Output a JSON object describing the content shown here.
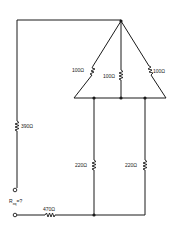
{
  "diagram": {
    "type": "circuit-schematic",
    "resistors": [
      {
        "id": "r_delta_left",
        "label": "100Ω"
      },
      {
        "id": "r_delta_center",
        "label": "100Ω"
      },
      {
        "id": "r_delta_right",
        "label": "100Ω"
      },
      {
        "id": "r_left_vertical",
        "label": "390Ω"
      },
      {
        "id": "r_mid_vertical",
        "label": "220Ω"
      },
      {
        "id": "r_right_vertical",
        "label": "220Ω"
      },
      {
        "id": "r_bottom_series",
        "label": "470Ω"
      }
    ],
    "terminal_label_main": "R",
    "terminal_label_sub": "eq",
    "terminal_label_suffix": "=?"
  }
}
